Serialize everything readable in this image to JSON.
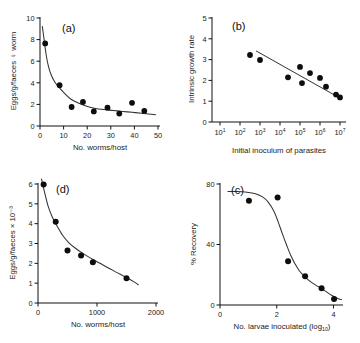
{
  "figure": {
    "name": "four-panel-parasite-density-dependence-figure",
    "panel_count": 4,
    "background_color": "#ffffff",
    "point_color": "#0d0d0d",
    "curve_color": "#333333",
    "axis_color": "#111111"
  },
  "chart_data": [
    {
      "id": "a",
      "type": "scatter",
      "tag": "(a)",
      "title": "",
      "xlabel": "No. worms/host",
      "ylabel": "Eggs/g/faeces ♀ worm",
      "xlim": [
        0,
        50
      ],
      "ylim": [
        0,
        10
      ],
      "xticks": [
        0,
        10,
        20,
        30,
        40,
        50
      ],
      "xticklabels": [
        "0",
        "10",
        "20",
        "30",
        "40",
        "50"
      ],
      "yticks": [
        0,
        2,
        4,
        6,
        8,
        10
      ],
      "yticklabels": [
        "0",
        "2",
        "4",
        "6",
        "8",
        "10"
      ],
      "xscale": "linear",
      "yscale": "linear",
      "grid": false,
      "legend": "none",
      "x": [
        2.2,
        8.3,
        13.4,
        18.2,
        22.8,
        28.6,
        33.6,
        39.0,
        44.2
      ],
      "y": [
        7.65,
        3.78,
        1.76,
        2.22,
        1.35,
        1.7,
        1.15,
        2.15,
        1.4
      ],
      "fit": {
        "kind": "decaying-power-curve",
        "note": "monotonic decreasing curve from ~9.2 at x=1 flattening to ~1.05 at x=49",
        "points": [
          [
            1.0,
            9.2
          ],
          [
            1.8,
            7.9
          ],
          [
            2.6,
            6.6
          ],
          [
            3.6,
            5.5
          ],
          [
            4.8,
            4.7
          ],
          [
            6.2,
            4.1
          ],
          [
            8.0,
            3.6
          ],
          [
            10.5,
            3.0
          ],
          [
            13.0,
            2.5
          ],
          [
            16.0,
            2.15
          ],
          [
            19.5,
            1.85
          ],
          [
            23.0,
            1.65
          ],
          [
            27.0,
            1.52
          ],
          [
            31.0,
            1.44
          ],
          [
            35.0,
            1.35
          ],
          [
            39.0,
            1.27
          ],
          [
            43.0,
            1.18
          ],
          [
            46.0,
            1.12
          ],
          [
            49.0,
            1.05
          ]
        ]
      }
    },
    {
      "id": "b",
      "type": "scatter",
      "tag": "(b)",
      "title": "",
      "xlabel": "Initial inoculum of parasites",
      "ylabel": "Intrinsic growth rate",
      "xlim_exponent": [
        1,
        7
      ],
      "ylim": [
        0,
        5
      ],
      "xticks_exponent": [
        1,
        2,
        3,
        4,
        5,
        6,
        7
      ],
      "xticklabels": [
        "10¹",
        "10²",
        "10³",
        "10⁴",
        "10⁵",
        "10⁶",
        "10⁷"
      ],
      "yticks": [
        0,
        1,
        2,
        3,
        4,
        5
      ],
      "yticklabels": [
        "0",
        "1",
        "2",
        "3",
        "4",
        "5"
      ],
      "xscale": "log10",
      "yscale": "linear",
      "grid": false,
      "legend": "none",
      "x_exponent": [
        2.5,
        3.0,
        4.4,
        5.0,
        5.1,
        5.5,
        6.0,
        6.3,
        6.8,
        7.0
      ],
      "y": [
        3.22,
        2.98,
        2.15,
        2.65,
        1.87,
        2.35,
        2.12,
        1.7,
        1.32,
        1.18
      ],
      "fit": {
        "kind": "linear-regression",
        "note": "straight declining line across log x axis",
        "x_exponent_start": 2.8,
        "y_start": 3.42,
        "x_exponent_end": 7.05,
        "y_end": 1.12
      }
    },
    {
      "id": "d",
      "type": "scatter",
      "tag": "(d)",
      "title": "",
      "xlabel": "No. worms/host",
      "ylabel": "Eggs/g/faeces × 10⁻³",
      "xlim": [
        0,
        2000
      ],
      "ylim": [
        0,
        6
      ],
      "xticks": [
        0,
        1000,
        2000
      ],
      "xticklabels": [
        "0",
        "1000",
        "2000"
      ],
      "yticks": [
        0,
        1,
        2,
        3,
        4,
        5,
        6
      ],
      "yticklabels": [
        "0",
        "1",
        "2",
        "3",
        "4",
        "5",
        "6"
      ],
      "xscale": "linear",
      "yscale": "linear",
      "grid": false,
      "legend": "none",
      "x": [
        95,
        300,
        500,
        730,
        930,
        1500
      ],
      "y": [
        5.98,
        4.1,
        2.65,
        2.4,
        2.05,
        1.25
      ],
      "fit": {
        "kind": "decaying-power-curve",
        "note": "steep decline from ~6.2 near origin flattening to ~0.9 at x=1700",
        "points": [
          [
            60,
            6.25
          ],
          [
            110,
            5.6
          ],
          [
            170,
            4.9
          ],
          [
            240,
            4.35
          ],
          [
            320,
            3.9
          ],
          [
            420,
            3.4
          ],
          [
            520,
            3.05
          ],
          [
            640,
            2.75
          ],
          [
            760,
            2.5
          ],
          [
            900,
            2.25
          ],
          [
            1050,
            2.0
          ],
          [
            1200,
            1.75
          ],
          [
            1350,
            1.52
          ],
          [
            1500,
            1.28
          ],
          [
            1620,
            1.08
          ],
          [
            1700,
            0.92
          ]
        ]
      }
    },
    {
      "id": "c",
      "type": "scatter",
      "tag": "(c)",
      "title": "",
      "xlabel": "No. larvae inoculated (log₁₀)",
      "ylabel": "% Recovery",
      "xlim": [
        0,
        4.3
      ],
      "ylim": [
        0,
        80
      ],
      "xticks": [
        0,
        2,
        4
      ],
      "xticklabels": [
        "0",
        "2",
        "4"
      ],
      "yticks": [
        0,
        40,
        80
      ],
      "yticklabels": [
        "0",
        "40",
        "80"
      ],
      "xscale": "linear",
      "yscale": "linear",
      "grid": false,
      "legend": "none",
      "x": [
        1.02,
        2.03,
        2.4,
        3.0,
        3.58,
        4.02
      ],
      "y": [
        69,
        71,
        29,
        19,
        11,
        4
      ],
      "fit": {
        "kind": "sigmoid-decreasing",
        "note": "plateau near 75% until x~1.6 then steep drop, tailing to ~3% at x=4.2",
        "points": [
          [
            0.28,
            75.0
          ],
          [
            0.6,
            75.0
          ],
          [
            0.95,
            74.6
          ],
          [
            1.25,
            73.6
          ],
          [
            1.5,
            71.5
          ],
          [
            1.7,
            68.0
          ],
          [
            1.9,
            62.0
          ],
          [
            2.05,
            55.0
          ],
          [
            2.2,
            47.0
          ],
          [
            2.35,
            39.5
          ],
          [
            2.5,
            32.5
          ],
          [
            2.65,
            27.0
          ],
          [
            2.8,
            22.5
          ],
          [
            3.0,
            18.5
          ],
          [
            3.2,
            15.3
          ],
          [
            3.45,
            12.3
          ],
          [
            3.7,
            9.3
          ],
          [
            3.95,
            6.3
          ],
          [
            4.15,
            4.3
          ],
          [
            4.28,
            3.6
          ]
        ]
      }
    }
  ]
}
